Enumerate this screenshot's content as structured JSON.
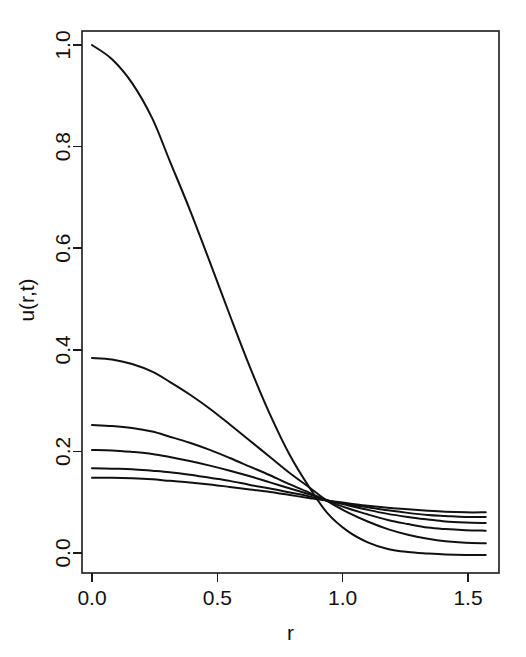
{
  "chart_data": {
    "type": "line",
    "title": "",
    "xlabel": "r",
    "ylabel": "u(r,t)",
    "xlim": [
      0.0,
      1.5708
    ],
    "ylim": [
      -0.02,
      1.02
    ],
    "grid": false,
    "legend": "none",
    "x_ticks": [
      "0.0",
      "0.5",
      "1.0",
      "1.5"
    ],
    "x_tick_values": [
      0.0,
      0.5,
      1.0,
      1.5
    ],
    "y_ticks": [
      "0.0",
      "0.2",
      "0.4",
      "0.6",
      "0.8",
      "1.0"
    ],
    "y_tick_values": [
      0.0,
      0.2,
      0.4,
      0.6,
      0.8,
      1.0
    ],
    "x": [
      0.0,
      0.08,
      0.16,
      0.24,
      0.31,
      0.39,
      0.47,
      0.55,
      0.63,
      0.71,
      0.79,
      0.87,
      0.94,
      1.02,
      1.1,
      1.18,
      1.26,
      1.34,
      1.41,
      1.49,
      1.5708
    ],
    "series": [
      {
        "name": "t1",
        "values": [
          1.0,
          0.972,
          0.925,
          0.856,
          0.772,
          0.676,
          0.573,
          0.468,
          0.366,
          0.273,
          0.192,
          0.127,
          0.078,
          0.043,
          0.021,
          0.008,
          0.002,
          -0.001,
          -0.003,
          -0.004,
          -0.004
        ]
      },
      {
        "name": "t2",
        "values": [
          0.384,
          0.381,
          0.372,
          0.357,
          0.337,
          0.312,
          0.284,
          0.253,
          0.221,
          0.189,
          0.157,
          0.128,
          0.102,
          0.08,
          0.062,
          0.047,
          0.036,
          0.028,
          0.023,
          0.02,
          0.019
        ]
      },
      {
        "name": "t3",
        "values": [
          0.252,
          0.25,
          0.246,
          0.239,
          0.229,
          0.217,
          0.203,
          0.187,
          0.17,
          0.153,
          0.135,
          0.118,
          0.102,
          0.088,
          0.076,
          0.065,
          0.057,
          0.05,
          0.047,
          0.045,
          0.044
        ]
      },
      {
        "name": "t4",
        "values": [
          0.203,
          0.202,
          0.199,
          0.195,
          0.189,
          0.181,
          0.172,
          0.162,
          0.151,
          0.139,
          0.127,
          0.115,
          0.104,
          0.094,
          0.085,
          0.077,
          0.071,
          0.066,
          0.062,
          0.06,
          0.059
        ]
      },
      {
        "name": "t5",
        "values": [
          0.167,
          0.166,
          0.165,
          0.162,
          0.159,
          0.154,
          0.148,
          0.142,
          0.134,
          0.127,
          0.119,
          0.111,
          0.103,
          0.096,
          0.09,
          0.084,
          0.079,
          0.075,
          0.073,
          0.071,
          0.071
        ]
      },
      {
        "name": "t6",
        "values": [
          0.148,
          0.148,
          0.147,
          0.145,
          0.142,
          0.139,
          0.135,
          0.13,
          0.125,
          0.12,
          0.114,
          0.108,
          0.103,
          0.098,
          0.093,
          0.089,
          0.086,
          0.083,
          0.081,
          0.08,
          0.08
        ]
      }
    ]
  },
  "axis": {
    "x_title": "r",
    "y_title": "u(r,t)"
  },
  "colors": {
    "curve": "#111111",
    "axis": "#1a1a1a",
    "background": "#ffffff"
  }
}
